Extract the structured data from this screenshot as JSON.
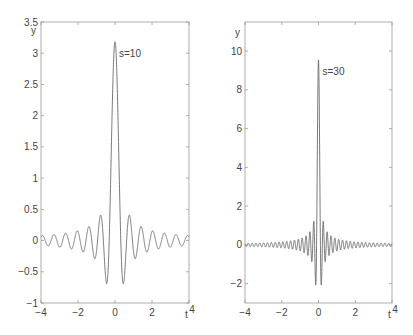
{
  "chart_data": [
    {
      "type": "line",
      "title": "",
      "function": "y = sin(s*t) / (pi*t)",
      "s": 10,
      "annotation": "s=10",
      "xlabel": "t",
      "ylabel": "y",
      "xlim": [
        -4,
        4
      ],
      "ylim": [
        -1,
        3.5
      ],
      "xticks": [
        -4,
        -2,
        0,
        2,
        4
      ],
      "xtick_labels": [
        "-4",
        "-2",
        "0",
        "2",
        "4"
      ],
      "yticks": [
        -1,
        -0.5,
        0,
        0.5,
        1,
        1.5,
        2,
        2.5,
        3,
        3.5
      ],
      "ytick_labels": [
        "-1",
        "-0.5",
        "0",
        "0.5",
        "1",
        "1.5",
        "2",
        "2.5",
        "3",
        "3.5"
      ],
      "grid": false,
      "peak": {
        "x": 0,
        "y": 3.18
      },
      "first_minima": [
        {
          "x": -0.45,
          "y": -0.69
        },
        {
          "x": 0.45,
          "y": -0.69
        }
      ],
      "second_maxima": [
        {
          "x": -0.77,
          "y": 0.41
        },
        {
          "x": 0.77,
          "y": 0.41
        }
      ],
      "frame_px": {
        "left": 41,
        "top": 22,
        "right": 189,
        "bottom": 303
      }
    },
    {
      "type": "line",
      "title": "",
      "function": "y = sin(s*t) / (pi*t)",
      "s": 30,
      "annotation": "s=30",
      "xlabel": "t",
      "ylabel": "y",
      "xlim": [
        -4,
        4
      ],
      "ylim": [
        -3,
        11.5
      ],
      "xticks": [
        -4,
        -2,
        0,
        2,
        4
      ],
      "xtick_labels": [
        "-4",
        "-2",
        "0",
        "2",
        "4"
      ],
      "yticks": [
        -2,
        0,
        2,
        4,
        6,
        8,
        10
      ],
      "ytick_labels": [
        "-2",
        "0",
        "2",
        "4",
        "6",
        "8",
        "10"
      ],
      "grid": false,
      "peak": {
        "x": 0,
        "y": 9.55
      },
      "first_minima": [
        {
          "x": -0.15,
          "y": -2.07
        },
        {
          "x": 0.15,
          "y": -2.07
        }
      ],
      "second_maxima": [
        {
          "x": -0.26,
          "y": 1.23
        },
        {
          "x": 0.26,
          "y": 1.23
        }
      ],
      "frame_px": {
        "left": 245,
        "top": 22,
        "right": 392,
        "bottom": 303
      }
    }
  ],
  "style": {
    "line_color": "#6b6b6b",
    "frame_color": "#9a9a9a",
    "text_color": "#444444",
    "background": "#ffffff"
  }
}
